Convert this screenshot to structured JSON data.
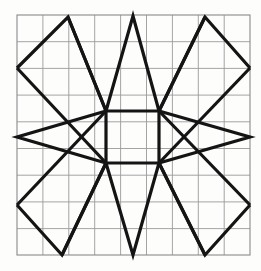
{
  "figure": {
    "canvas": {
      "width": 261,
      "height": 271,
      "background": "#fdfdfc"
    },
    "grid": {
      "name": "square-grid",
      "left": 17,
      "top": 15,
      "right": 250,
      "bottom": 255,
      "columns": 9,
      "rows": 9,
      "cell_width": 25.9,
      "cell_height": 26.7,
      "line_color": "#9a9a9a",
      "line_width": 0.9,
      "border_color": "#8a8a8a",
      "border_width": 1.1
    },
    "star": {
      "name": "eight-pointed-star",
      "stroke_color": "#141414",
      "stroke_width": 3.2,
      "fill": "none",
      "center": {
        "x": 132.5,
        "y": 137
      },
      "inner_square": {
        "name": "central-square",
        "points": "106,111 159,111 159,163 106,163",
        "corners": [
          {
            "label": "top-left",
            "x": 106,
            "y": 111
          },
          {
            "label": "top-right",
            "x": 159,
            "y": 111
          },
          {
            "label": "bottom-right",
            "x": 159,
            "y": 163
          },
          {
            "label": "bottom-left",
            "x": 106,
            "y": 163
          }
        ]
      },
      "points": [
        {
          "label": "north",
          "tip": {
            "x": 133,
            "y": 16
          },
          "base_left": {
            "x": 106,
            "y": 111
          },
          "base_right": {
            "x": 159,
            "y": 111
          },
          "polyline": "106,111 133,16 159,111"
        },
        {
          "label": "northeast",
          "tip": {
            "x": 205,
            "y": 17
          },
          "base_left": {
            "x": 159,
            "y": 111
          },
          "base_right": {
            "x": 250,
            "y": 68
          },
          "polyline": "159,111 205,17 250,68"
        },
        {
          "label": "east",
          "tip": {
            "x": 250,
            "y": 137
          },
          "base_left": {
            "x": 159,
            "y": 111
          },
          "base_right": {
            "x": 159,
            "y": 163
          },
          "polyline": "159,111 250,137 159,163"
        },
        {
          "label": "southeast",
          "tip": {
            "x": 205,
            "y": 255
          },
          "base_left": {
            "x": 250,
            "y": 205
          },
          "base_right": {
            "x": 159,
            "y": 163
          },
          "polyline": "250,205 205,255 159,163"
        },
        {
          "label": "south",
          "tip": {
            "x": 133,
            "y": 255
          },
          "base_left": {
            "x": 159,
            "y": 163
          },
          "base_right": {
            "x": 106,
            "y": 163
          },
          "polyline": "159,163 133,255 106,163"
        },
        {
          "label": "southwest",
          "tip": {
            "x": 62,
            "y": 255
          },
          "base_left": {
            "x": 106,
            "y": 163
          },
          "base_right": {
            "x": 17,
            "y": 205
          },
          "polyline": "106,163 62,255 17,205"
        },
        {
          "label": "west",
          "tip": {
            "x": 17,
            "y": 137
          },
          "base_left": {
            "x": 106,
            "y": 163
          },
          "base_right": {
            "x": 106,
            "y": 111
          },
          "polyline": "106,163 17,137 106,111"
        },
        {
          "label": "northwest",
          "tip": {
            "x": 68,
            "y": 17
          },
          "base_left": {
            "x": 17,
            "y": 68
          },
          "base_right": {
            "x": 106,
            "y": 111
          },
          "polyline": "17,68 68,17 106,111"
        }
      ],
      "connector_segments": [
        {
          "label": "nw-tip-to-center-top-left",
          "x1": 68,
          "y1": 17,
          "x2": 106,
          "y2": 111
        },
        {
          "label": "ne-tip-to-center-top-right",
          "x1": 205,
          "y1": 17,
          "x2": 159,
          "y2": 111
        },
        {
          "label": "sw-tip-to-center-bottom-left",
          "x1": 62,
          "y1": 255,
          "x2": 106,
          "y2": 163
        },
        {
          "label": "se-tip-to-center-bottom-right",
          "x1": 205,
          "y1": 255,
          "x2": 159,
          "y2": 163
        },
        {
          "label": "west-corner-upper-to-center-bottom-left",
          "x1": 17,
          "y1": 68,
          "x2": 106,
          "y2": 163
        },
        {
          "label": "east-corner-upper-to-center-bottom-right",
          "x1": 250,
          "y1": 68,
          "x2": 159,
          "y2": 163
        },
        {
          "label": "west-corner-lower-to-center-top-left",
          "x1": 17,
          "y1": 205,
          "x2": 106,
          "y2": 111
        },
        {
          "label": "east-corner-lower-to-center-top-right",
          "x1": 250,
          "y1": 205,
          "x2": 159,
          "y2": 111
        }
      ]
    }
  }
}
